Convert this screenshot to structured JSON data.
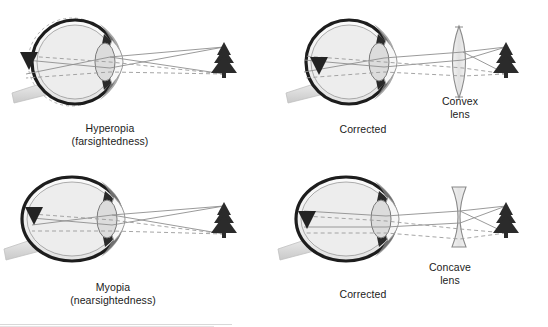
{
  "figure": {
    "background": "#ffffff",
    "ink": "#1a1a1a",
    "ray_solid_color": "#8a8a8a",
    "ray_dashed_color": "#9a9a9a",
    "sclera_fill": "#efefef",
    "vitreous_fill": "#e8e8e8",
    "lens_fill": "#dcdcdc",
    "tree_color": "#2b2b2b",
    "arrow_color": "#222222",
    "nerve_fill": "#d9d9d9"
  },
  "panels": [
    {
      "id": "hyperopia",
      "eye_shape": "spherical-short",
      "has_correcting_lens": false,
      "correcting_lens_type": null,
      "focus_location": "behind-retina",
      "object_icon": "pine-tree-icon",
      "image_icon": "inverted-arrow-icon",
      "reference_outline": "dashed-normal-eye-outline",
      "caption": {
        "line1": "Hyperopia",
        "line2": "(farsightedness)"
      },
      "lens_caption": {
        "line1": "",
        "line2": ""
      }
    },
    {
      "id": "hyperopia-corrected",
      "eye_shape": "spherical-short",
      "has_correcting_lens": true,
      "correcting_lens_type": "convex",
      "focus_location": "on-retina",
      "object_icon": "pine-tree-icon",
      "image_icon": "inverted-arrow-icon",
      "reference_outline": "none",
      "caption": {
        "line1": "Corrected",
        "line2": ""
      },
      "lens_caption": {
        "line1": "Convex",
        "line2": "lens"
      }
    },
    {
      "id": "myopia",
      "eye_shape": "elongated-oval",
      "has_correcting_lens": false,
      "correcting_lens_type": null,
      "focus_location": "in-front-of-retina",
      "object_icon": "pine-tree-icon",
      "image_icon": "inverted-arrow-icon",
      "reference_outline": "dashed-normal-eye-outline",
      "caption": {
        "line1": "Myopia",
        "line2": "(nearsightedness)"
      },
      "lens_caption": {
        "line1": "",
        "line2": ""
      }
    },
    {
      "id": "myopia-corrected",
      "eye_shape": "elongated-oval",
      "has_correcting_lens": true,
      "correcting_lens_type": "concave",
      "focus_location": "on-retina",
      "object_icon": "pine-tree-icon",
      "image_icon": "inverted-arrow-icon",
      "reference_outline": "none",
      "caption": {
        "line1": "Corrected",
        "line2": ""
      },
      "lens_caption": {
        "line1": "Concave",
        "line2": "lens"
      }
    }
  ]
}
